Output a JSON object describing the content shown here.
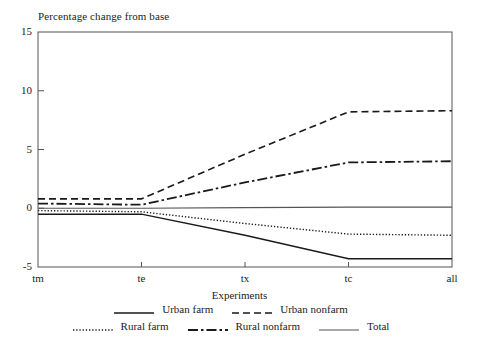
{
  "chart_data": {
    "type": "line",
    "title": "Percentage change from base",
    "xlabel": "Experiments",
    "ylabel": "",
    "categories": [
      "tm",
      "te",
      "tx",
      "tc",
      "all"
    ],
    "yticks": [
      "15",
      "10",
      "5",
      "0",
      "-5"
    ],
    "ylim": [
      -5,
      15
    ],
    "grid": false,
    "legend_position": "bottom",
    "series": [
      {
        "name": "Urban farm",
        "style": "solid",
        "color": "#1a1a1a",
        "values": [
          -0.5,
          -0.5,
          -2.3,
          -4.3,
          -4.3
        ]
      },
      {
        "name": "Urban nonfarm",
        "style": "dashed",
        "color": "#1a1a1a",
        "values": [
          0.8,
          0.8,
          4.6,
          8.2,
          8.3
        ]
      },
      {
        "name": "Rural farm",
        "style": "dotted",
        "color": "#1a1a1a",
        "values": [
          -0.2,
          -0.3,
          -1.3,
          -2.2,
          -2.3
        ]
      },
      {
        "name": "Rural nonfarm",
        "style": "dashdot",
        "color": "#1a1a1a",
        "values": [
          0.4,
          0.3,
          2.2,
          3.9,
          4.0
        ]
      },
      {
        "name": "Total",
        "style": "solid-thin",
        "color": "#555555",
        "values": [
          0.0,
          0.0,
          0.05,
          0.1,
          0.1
        ]
      }
    ]
  },
  "legend": {
    "row1": [
      "Urban farm",
      "Urban nonfarm"
    ],
    "row2": [
      "Rural farm",
      "Rural nonfarm",
      "Total"
    ]
  }
}
